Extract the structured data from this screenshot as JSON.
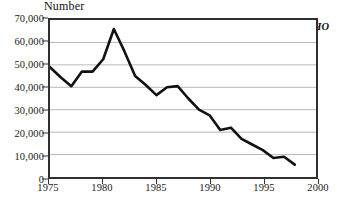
{
  "chart_data": {
    "type": "line",
    "title": "Number",
    "xlabel": "",
    "ylabel": "Number",
    "annotation": "Source: WHO",
    "grid": "horizontal",
    "legend": "none",
    "xlim": [
      1975,
      2000
    ],
    "ylim": [
      0,
      70000
    ],
    "y_ticks": [
      0,
      10000,
      20000,
      30000,
      40000,
      50000,
      60000,
      70000
    ],
    "y_tick_labels": [
      "0",
      "10,000",
      "20,000",
      "30,000",
      "40,000",
      "50,000",
      "60,000",
      "70,000"
    ],
    "x_ticks": [
      1975,
      1980,
      1985,
      1990,
      1995,
      2000
    ],
    "x_tick_labels": [
      "1975",
      "1980",
      "1985",
      "1990",
      "1995",
      "2000"
    ],
    "series": [
      {
        "name": "Number",
        "color": "#111111",
        "x": [
          1975,
          1976,
          1977,
          1978,
          1979,
          1980,
          1981,
          1982,
          1983,
          1984,
          1985,
          1986,
          1987,
          1988,
          1989,
          1990,
          1991,
          1992,
          1993,
          1994,
          1995,
          1996,
          1997,
          1998
        ],
        "values": [
          49000,
          44500,
          40500,
          47000,
          47000,
          52500,
          66000,
          56000,
          45000,
          41000,
          36500,
          40000,
          40500,
          35000,
          30000,
          27500,
          21000,
          22000,
          17000,
          14500,
          12000,
          8500,
          9000,
          5500
        ]
      }
    ]
  }
}
